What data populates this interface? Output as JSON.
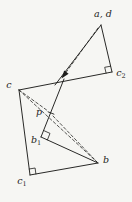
{
  "figure": {
    "type": "geometry-diagram",
    "background": "#f6f6f3",
    "ink": "#1d1d1b",
    "points": [
      {
        "id": "ad",
        "x": 101,
        "y": 25,
        "label": {
          "base": "a, d",
          "sub": ""
        },
        "label_x": 103,
        "label_y": 14
      },
      {
        "id": "c2",
        "x": 112,
        "y": 72,
        "label": {
          "base": "c",
          "sub": "2"
        },
        "label_x": 121,
        "label_y": 74
      },
      {
        "id": "c",
        "x": 19,
        "y": 90,
        "label": {
          "base": "c",
          "sub": ""
        },
        "label_x": 9,
        "label_y": 85
      },
      {
        "id": "p",
        "x": 51,
        "y": 113,
        "label": {
          "base": "p",
          "sub": ""
        },
        "label_x": 39,
        "label_y": 112
      },
      {
        "id": "b1",
        "x": 41,
        "y": 137,
        "label": {
          "base": "b",
          "sub": "1"
        },
        "label_x": 36,
        "label_y": 141
      },
      {
        "id": "b",
        "x": 98,
        "y": 163,
        "label": {
          "base": "b",
          "sub": ""
        },
        "label_x": 106,
        "label_y": 160
      },
      {
        "id": "c1",
        "x": 30,
        "y": 175,
        "label": {
          "base": "c",
          "sub": "1"
        },
        "label_x": 22,
        "label_y": 182
      }
    ],
    "solid_segments": [
      {
        "name": "ray-ad-to-mirror",
        "from": [
          101,
          25
        ],
        "to": [
          55,
          85
        ]
      },
      {
        "name": "mirror-to-b1",
        "from": [
          64,
          79
        ],
        "to": [
          41,
          137
        ]
      },
      {
        "name": "ad-c2",
        "from": [
          101,
          25
        ],
        "to": [
          112,
          72
        ]
      },
      {
        "name": "c2-c",
        "from": [
          112,
          72
        ],
        "to": [
          19,
          90
        ]
      },
      {
        "name": "c-c1",
        "from": [
          19,
          90
        ],
        "to": [
          30,
          175
        ]
      },
      {
        "name": "c1-b",
        "from": [
          30,
          175
        ],
        "to": [
          98,
          163
        ]
      },
      {
        "name": "b1-b",
        "from": [
          41,
          137
        ],
        "to": [
          98,
          163
        ]
      }
    ],
    "dashed_segments": [
      {
        "name": "d-ray-dashed",
        "from": [
          98,
          28
        ],
        "to": [
          62,
          78
        ]
      },
      {
        "name": "c-p",
        "from": [
          19,
          90
        ],
        "to": [
          48,
          111
        ]
      },
      {
        "name": "p-b",
        "from": [
          53,
          116
        ],
        "to": [
          97,
          162
        ]
      },
      {
        "name": "c-b",
        "from": [
          19,
          90
        ],
        "to": [
          97,
          162
        ]
      }
    ],
    "right_angle_markers": [
      {
        "at": "c2",
        "pts": [
          [
            110.6,
            66.2
          ],
          [
            104.7,
            67.3
          ],
          [
            106.1,
            73.1
          ]
        ]
      },
      {
        "at": "b1",
        "pts": [
          [
            43.6,
            130.5
          ],
          [
            50.0,
            133.4
          ],
          [
            47.4,
            139.9
          ]
        ]
      },
      {
        "at": "c1",
        "pts": [
          [
            29.2,
            169.0
          ],
          [
            35.1,
            168.0
          ],
          [
            35.9,
            174.0
          ]
        ]
      }
    ],
    "arrowhead": {
      "on": "ray-ad-to-mirror",
      "pts": [
        [
          61.5,
          78.5
        ],
        [
          64.2,
          70.4
        ],
        [
          68.6,
          73.8
        ]
      ]
    },
    "point_tick": {
      "at": "p",
      "from": [
        47.7,
        111.7
      ],
      "to": [
        54.3,
        114.3
      ]
    }
  }
}
